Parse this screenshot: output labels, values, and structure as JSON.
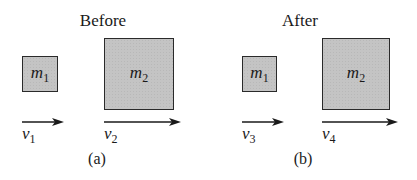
{
  "panels": [
    {
      "heading": "Before",
      "caption": "(a)",
      "masses": [
        {
          "symbol": "m",
          "subscript": "1"
        },
        {
          "symbol": "m",
          "subscript": "2"
        }
      ],
      "velocities": [
        {
          "symbol": "v",
          "subscript": "1"
        },
        {
          "symbol": "v",
          "subscript": "2"
        }
      ]
    },
    {
      "heading": "After",
      "caption": "(b)",
      "masses": [
        {
          "symbol": "m",
          "subscript": "1"
        },
        {
          "symbol": "m",
          "subscript": "2"
        }
      ],
      "velocities": [
        {
          "symbol": "v",
          "subscript": "3"
        },
        {
          "symbol": "v",
          "subscript": "4"
        }
      ]
    }
  ],
  "colors": {
    "box_fill": "#c4c4c4",
    "stroke": "#2a2a2a",
    "text": "#1a1a1a"
  },
  "icons": {
    "velocity_arrow": "right-arrow-icon"
  }
}
